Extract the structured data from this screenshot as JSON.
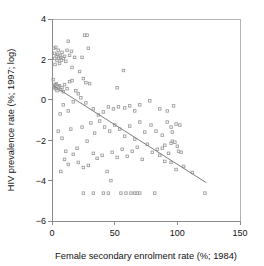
{
  "figure": {
    "background_color": "#ffffff",
    "marker_color": "#9b9b9b",
    "line_color": "#7d7d7d",
    "axis_color": "#8a8a8a"
  },
  "axes": {
    "x_title": "Female secondary enrolment rate (%; 1984)",
    "y_title": "HIV prevalence rate (%; 1997; log)",
    "x_ticks": [
      "0",
      "50",
      "100",
      "150"
    ],
    "y_ticks": [
      "4",
      "2",
      "0",
      "−2",
      "−4",
      "−6"
    ]
  },
  "chart_data": {
    "type": "scatter",
    "title": "",
    "subtitle": "",
    "xlabel": "Female secondary enrolment rate (%; 1984)",
    "ylabel": "HIV prevalence rate (%; 1997; log)",
    "xlim": [
      0,
      150
    ],
    "ylim": [
      -6,
      4
    ],
    "xticks": [
      0,
      50,
      100,
      150
    ],
    "yticks": [
      -6,
      -4,
      -2,
      0,
      2,
      4
    ],
    "grid": false,
    "legend": "none",
    "annotations": [],
    "series": [
      {
        "name": "Countries",
        "marker": "open-square",
        "points": [
          [
            1.5,
            2.55
          ],
          [
            2.0,
            2.3
          ],
          [
            2.2,
            2.05
          ],
          [
            2.4,
            1.75
          ],
          [
            3.0,
            2.6
          ],
          [
            3.5,
            2.15
          ],
          [
            4.0,
            1.95
          ],
          [
            4.5,
            2.25
          ],
          [
            5.0,
            2.45
          ],
          [
            5.5,
            2.05
          ],
          [
            6.0,
            1.8
          ],
          [
            6.5,
            2.2
          ],
          [
            7.0,
            2.1
          ],
          [
            7.5,
            1.95
          ],
          [
            8.0,
            2.35
          ],
          [
            9.0,
            2.05
          ],
          [
            10.0,
            2.15
          ],
          [
            11.0,
            1.9
          ],
          [
            12.0,
            2.45
          ],
          [
            13.0,
            2.9
          ],
          [
            14.0,
            2.2
          ],
          [
            15.5,
            2.4
          ],
          [
            16.0,
            1.6
          ],
          [
            18.0,
            2.1
          ],
          [
            24.0,
            2.1
          ],
          [
            26.0,
            3.2
          ],
          [
            28.0,
            3.2
          ],
          [
            29.0,
            2.55
          ],
          [
            22.0,
            1.4
          ],
          [
            25.0,
            1.05
          ],
          [
            27.0,
            0.85
          ],
          [
            30.0,
            0.8
          ],
          [
            57.0,
            1.45
          ],
          [
            52.0,
            0.6
          ],
          [
            1.0,
            1.0
          ],
          [
            1.5,
            0.7
          ],
          [
            2.0,
            0.6
          ],
          [
            2.5,
            0.75
          ],
          [
            3.0,
            0.55
          ],
          [
            3.5,
            0.8
          ],
          [
            4.0,
            0.45
          ],
          [
            5.0,
            0.65
          ],
          [
            6.0,
            0.7
          ],
          [
            7.0,
            0.5
          ],
          [
            8.0,
            0.6
          ],
          [
            9.0,
            0.4
          ],
          [
            10.0,
            0.75
          ],
          [
            12.0,
            0.55
          ],
          [
            14.0,
            0.9
          ],
          [
            16.0,
            0.95
          ],
          [
            19.0,
            0.45
          ],
          [
            21.0,
            0.3
          ],
          [
            23.0,
            0.1
          ],
          [
            6.5,
            -0.7
          ],
          [
            9.0,
            -0.25
          ],
          [
            13.0,
            -0.55
          ],
          [
            17.0,
            -0.1
          ],
          [
            27.0,
            -0.15
          ],
          [
            33.0,
            -0.45
          ],
          [
            37.0,
            -0.75
          ],
          [
            41.0,
            -0.6
          ],
          [
            45.0,
            -0.35
          ],
          [
            49.0,
            -0.45
          ],
          [
            53.0,
            -0.35
          ],
          [
            58.0,
            -0.4
          ],
          [
            62.0,
            -0.3
          ],
          [
            66.0,
            -0.55
          ],
          [
            70.0,
            -0.25
          ],
          [
            78.0,
            -0.05
          ],
          [
            86.0,
            -0.45
          ],
          [
            92.0,
            -0.55
          ],
          [
            97.0,
            -0.3
          ],
          [
            5.0,
            -1.55
          ],
          [
            8.0,
            -1.9
          ],
          [
            11.0,
            -2.55
          ],
          [
            15.0,
            -1.45
          ],
          [
            20.0,
            -2.4
          ],
          [
            24.0,
            -1.35
          ],
          [
            28.0,
            -2.05
          ],
          [
            31.0,
            -1.15
          ],
          [
            34.0,
            -1.65
          ],
          [
            38.0,
            -1.05
          ],
          [
            42.0,
            -1.35
          ],
          [
            46.0,
            -1.55
          ],
          [
            50.0,
            -1.25
          ],
          [
            54.0,
            -1.45
          ],
          [
            58.0,
            -1.8
          ],
          [
            62.0,
            -1.3
          ],
          [
            66.0,
            -1.95
          ],
          [
            70.0,
            -1.1
          ],
          [
            74.0,
            -1.6
          ],
          [
            79.0,
            -1.25
          ],
          [
            83.0,
            -1.55
          ],
          [
            88.0,
            -1.75
          ],
          [
            92.0,
            -1.1
          ],
          [
            95.0,
            -1.35
          ],
          [
            96.0,
            -1.6
          ],
          [
            99.0,
            -1.2
          ],
          [
            102.0,
            -1.25
          ],
          [
            7.0,
            -3.55
          ],
          [
            10.0,
            -2.95
          ],
          [
            13.0,
            -3.2
          ],
          [
            17.0,
            -2.7
          ],
          [
            21.0,
            -3.1
          ],
          [
            25.0,
            -3.35
          ],
          [
            29.0,
            -3.25
          ],
          [
            33.0,
            -2.65
          ],
          [
            36.0,
            -2.9
          ],
          [
            40.0,
            -2.75
          ],
          [
            44.0,
            -3.55
          ],
          [
            48.0,
            -2.6
          ],
          [
            52.0,
            -2.85
          ],
          [
            56.0,
            -2.45
          ],
          [
            60.0,
            -2.8
          ],
          [
            64.0,
            -2.55
          ],
          [
            68.0,
            -2.35
          ],
          [
            72.0,
            -2.95
          ],
          [
            76.0,
            -2.2
          ],
          [
            80.0,
            -2.6
          ],
          [
            84.0,
            -2.45
          ],
          [
            88.0,
            -2.4
          ],
          [
            90.0,
            -2.25
          ],
          [
            93.0,
            -2.65
          ],
          [
            95.0,
            -2.15
          ],
          [
            96.0,
            -2.05
          ],
          [
            98.0,
            -2.1
          ],
          [
            100.0,
            -2.3
          ],
          [
            101.0,
            -2.55
          ],
          [
            103.0,
            -2.6
          ],
          [
            86.0,
            -2.75
          ],
          [
            90.0,
            -3.05
          ],
          [
            95.0,
            -3.1
          ],
          [
            99.0,
            -3.45
          ],
          [
            105.0,
            -3.3
          ],
          [
            112.0,
            -3.6
          ],
          [
            47.0,
            -4.0
          ],
          [
            25.0,
            -4.62
          ],
          [
            33.0,
            -4.62
          ],
          [
            41.0,
            -4.62
          ],
          [
            45.0,
            -4.62
          ],
          [
            55.0,
            -4.62
          ],
          [
            59.0,
            -4.62
          ],
          [
            63.0,
            -4.62
          ],
          [
            66.0,
            -4.62
          ],
          [
            68.0,
            -4.62
          ],
          [
            70.0,
            -4.62
          ],
          [
            82.0,
            -4.62
          ],
          [
            122.0,
            -4.62
          ]
        ]
      }
    ],
    "fit_line": {
      "name": "regression line",
      "x_start": 1.0,
      "y_start": 0.7,
      "x_end": 123.0,
      "y_end": -4.1
    }
  }
}
